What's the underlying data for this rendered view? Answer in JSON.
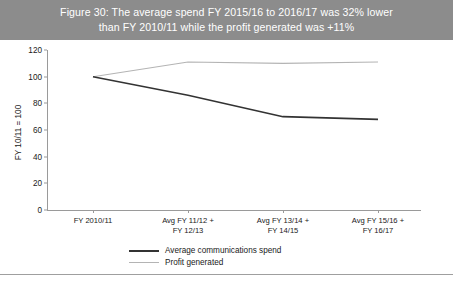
{
  "header": {
    "title_line1": "Figure 30: The average spend FY 2015/16 to 2016/17 was 32% lower",
    "title_line2": "than FY 2010/11 while the profit generated was +11%",
    "background_color": "#8c8c8c",
    "text_color": "#ffffff"
  },
  "chart_data": {
    "type": "line",
    "title": "Figure 30: The average spend FY 2015/16 to 2016/17 was 32% lower than FY 2010/11 while the profit generated was +11%",
    "xlabel": "",
    "ylabel": "FY 10/11 = 100",
    "categories": [
      "FY 2010/11",
      "Avg FY 11/12 + FY 12/13",
      "Avg FY 13/14 + FY 14/15",
      "Avg FY 15/16 + FY 16/17"
    ],
    "category_lines": [
      [
        "FY 2010/11",
        ""
      ],
      [
        "Avg FY 11/12 +",
        "FY 12/13"
      ],
      [
        "Avg FY 13/14 +",
        "FY 14/15"
      ],
      [
        "Avg FY 15/16 +",
        "FY 16/17"
      ]
    ],
    "series": [
      {
        "name": "Average communications spend",
        "values": [
          100,
          86,
          70,
          68
        ],
        "color": "#333333"
      },
      {
        "name": "Profit generated",
        "values": [
          100,
          111,
          110,
          111
        ],
        "color": "#b4b4b4"
      }
    ],
    "ylim": [
      0,
      120
    ],
    "ytick_values": [
      0,
      20,
      40,
      60,
      80,
      100,
      120
    ],
    "ytick_labels": [
      "0",
      "20",
      "40",
      "60",
      "80",
      "100",
      "120"
    ],
    "grid": false,
    "legend_position": "bottom"
  },
  "legend": {
    "items": [
      {
        "label": "Average communications spend"
      },
      {
        "label": "Profit generated"
      }
    ]
  }
}
